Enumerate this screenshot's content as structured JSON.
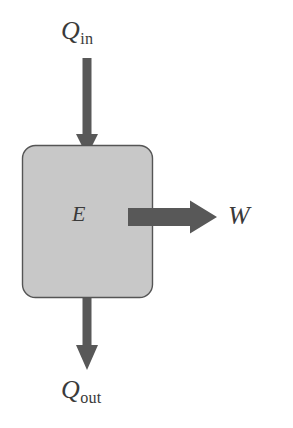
{
  "diagram": {
    "system": {
      "name": "system-block",
      "label_symbol": "E",
      "label_full": "E",
      "fill_color": "#c8c8c8",
      "stroke_color": "#555555",
      "corner_radius": 12,
      "x": 22,
      "y": 145,
      "width": 130,
      "height": 152
    },
    "arrows": [
      {
        "name": "heat-in-arrow",
        "direction": "down",
        "label_symbol": "Q",
        "label_subscript": "in",
        "label_full": "Qin",
        "color": "#585858"
      },
      {
        "name": "work-out-arrow",
        "direction": "right",
        "label_symbol": "W",
        "label_subscript": "",
        "label_full": "W",
        "color": "#585858"
      },
      {
        "name": "heat-out-arrow",
        "direction": "down",
        "label_symbol": "Q",
        "label_subscript": "out",
        "label_full": "Qout",
        "color": "#585858"
      }
    ],
    "colors": {
      "background": "#ffffff",
      "box_fill": "#c8c8c8",
      "box_stroke": "#555555",
      "arrow_fill": "#585858",
      "text": "#3a3a3a"
    }
  }
}
